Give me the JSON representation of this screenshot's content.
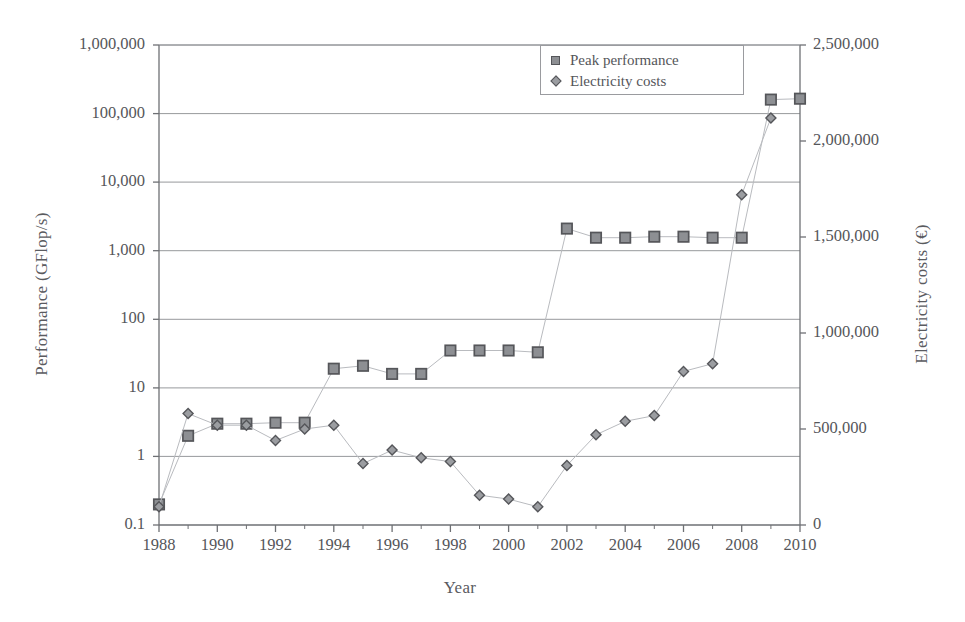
{
  "chart_data": {
    "type": "line",
    "title": "",
    "xlabel": "Year",
    "ylabel": "Performance (GFlop/s)",
    "ylabel_right": "Electricity costs (€)",
    "x": [
      1988,
      1989,
      1990,
      1991,
      1992,
      1993,
      1994,
      1995,
      1996,
      1997,
      1998,
      1999,
      2000,
      2001,
      2002,
      2003,
      2004,
      2005,
      2006,
      2007,
      2008,
      2009,
      2010
    ],
    "xlim": [
      1988,
      2010
    ],
    "xticks": [
      1988,
      1990,
      1992,
      1994,
      1996,
      1998,
      2000,
      2002,
      2004,
      2006,
      2008,
      2010
    ],
    "xtick_labels": [
      "1988",
      "1990",
      "1992",
      "1994",
      "1996",
      "1998",
      "2000",
      "2002",
      "2004",
      "2006",
      "2008",
      "2010"
    ],
    "x_minor_ticks": [
      1989,
      1991,
      1993,
      1995,
      1997,
      1999,
      2001,
      2003,
      2005,
      2007,
      2009
    ],
    "yscale": "log",
    "ylim": [
      0.1,
      1000000
    ],
    "yticks": [
      0.1,
      1,
      10,
      100,
      1000,
      10000,
      100000,
      1000000
    ],
    "ytick_labels": [
      "0.1",
      "1",
      "10",
      "100",
      "1,000",
      "10,000",
      "100,000",
      "1,000,000"
    ],
    "y2scale": "linear",
    "y2lim": [
      0,
      2500000
    ],
    "y2ticks": [
      0,
      500000,
      1000000,
      1500000,
      2000000,
      2500000
    ],
    "y2tick_labels": [
      "0",
      "500,000",
      "1,000,000",
      "1,500,000",
      "2,000,000",
      "2,500,000"
    ],
    "grid": "horizontal",
    "legend_position": "top-center-right",
    "series": [
      {
        "name": "Peak performance",
        "axis": "left",
        "marker": "square",
        "color": "#8d8f93",
        "edge_color": "#55565a",
        "units": "GFlop/s",
        "values": [
          0.2,
          2.0,
          3.0,
          3.0,
          3.1,
          3.1,
          19,
          21,
          16,
          16,
          35,
          35,
          35,
          33,
          2100,
          1550,
          1550,
          1600,
          1600,
          1550,
          1550,
          160000,
          165000
        ]
      },
      {
        "name": "Electricity costs",
        "axis": "right",
        "marker": "diamond",
        "color": "#9b9da1",
        "edge_color": "#55565a",
        "units": "€",
        "values": [
          95000,
          580000,
          520000,
          520000,
          440000,
          500000,
          520000,
          320000,
          390000,
          350000,
          330000,
          155000,
          135000,
          95000,
          310000,
          470000,
          540000,
          570000,
          800000,
          840000,
          1720000,
          2120000,
          null
        ]
      }
    ]
  },
  "legend": {
    "items": [
      {
        "label": "Peak performance",
        "marker": "square-marker-icon"
      },
      {
        "label": "Electricity costs",
        "marker": "diamond-marker-icon"
      }
    ]
  }
}
